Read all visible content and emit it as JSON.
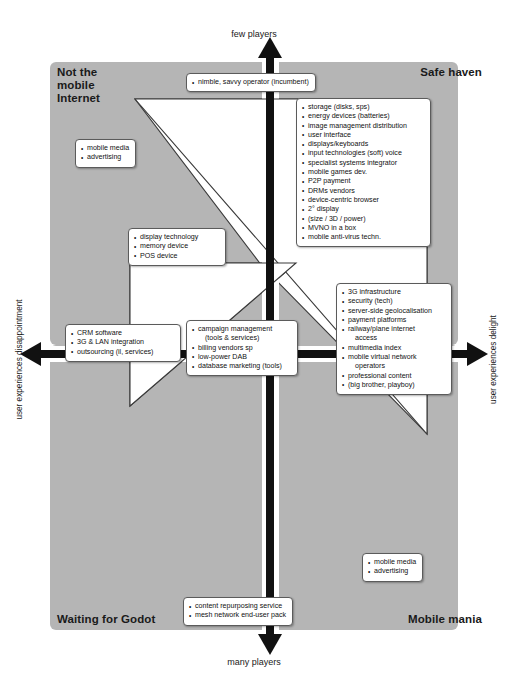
{
  "diagram": {
    "colors": {
      "quadrant_fill": "#b5b5b5",
      "center_fill": "#ffffff",
      "arrow": "#111111",
      "box_border": "#5b5b5b",
      "text": "#111111"
    },
    "axes": {
      "top_label": "few players",
      "bottom_label": "many players",
      "left_label": "user experiences disappointment",
      "right_label": "user experiences delight"
    },
    "quadrants": [
      {
        "id": "top-left",
        "label": "Not the\nmobile\nInternet"
      },
      {
        "id": "top-right",
        "label": "Safe haven"
      },
      {
        "id": "bottom-left",
        "label": "Waiting for Godot"
      },
      {
        "id": "bottom-right",
        "label": "Mobile mania"
      }
    ],
    "callouts": {
      "top": {
        "id": "top-center-callout",
        "items": [
          {
            "text": "nimble, savvy operator (incumbent)",
            "bullet": true
          }
        ]
      },
      "north_east": {
        "id": "safe-haven-list",
        "items": [
          {
            "text": "storage (disks, sps)",
            "bullet": true
          },
          {
            "text": "energy devices (batteries)",
            "bullet": true
          },
          {
            "text": "image management distribution",
            "bullet": true
          },
          {
            "text": "user interface",
            "bullet": true
          },
          {
            "text": "displays/keyboards",
            "bullet": true
          },
          {
            "text": "input technologies (soft) voice",
            "bullet": true
          },
          {
            "text": "specialist systems integrator",
            "bullet": true
          },
          {
            "text": "mobile games dev.",
            "bullet": true
          },
          {
            "text": "P2P payment",
            "bullet": true
          },
          {
            "text": "DRMs vendors",
            "bullet": true
          },
          {
            "text": "device-centric browser",
            "bullet": true
          },
          {
            "text": "2° display",
            "bullet": true
          },
          {
            "text": "(size / 3D / power)",
            "bullet": true
          },
          {
            "text": "MVNO in a box",
            "bullet": true
          },
          {
            "text": "mobile anti-virus techn.",
            "bullet": true
          }
        ]
      },
      "north_west": {
        "id": "not-the-mobile-internet-list",
        "items": [
          {
            "text": "mobile media",
            "bullet": true
          },
          {
            "text": "advertising",
            "bullet": true
          }
        ]
      },
      "mid_left_upper": {
        "id": "display-technology-list",
        "items": [
          {
            "text": "display technology",
            "bullet": true
          },
          {
            "text": "memory device",
            "bullet": true
          },
          {
            "text": "POS device",
            "bullet": true
          }
        ]
      },
      "west": {
        "id": "disappointment-list",
        "items": [
          {
            "text": "CRM software",
            "bullet": true
          },
          {
            "text": "3G & LAN integration",
            "bullet": true
          },
          {
            "text": "outsourcing (il, services)",
            "bullet": true
          }
        ]
      },
      "center": {
        "id": "center-list",
        "items": [
          {
            "text": "campaign management",
            "bullet": true
          },
          {
            "text": "(tools & services)",
            "bullet": false,
            "continuation": true
          },
          {
            "text": "billing vendors sp",
            "bullet": true
          },
          {
            "text": "low-power DAB",
            "bullet": true
          },
          {
            "text": "database marketing (tools)",
            "bullet": true
          }
        ]
      },
      "east": {
        "id": "delight-list",
        "items": [
          {
            "text": "3G infrastructure",
            "bullet": true
          },
          {
            "text": "security (tech)",
            "bullet": true
          },
          {
            "text": "server-side geolocalisation",
            "bullet": true
          },
          {
            "text": "payment platforms",
            "bullet": true
          },
          {
            "text": "railway/plane internet",
            "bullet": true
          },
          {
            "text": "access",
            "bullet": false,
            "continuation": true
          },
          {
            "text": "multimedia index",
            "bullet": true
          },
          {
            "text": "mobile virtual network",
            "bullet": true
          },
          {
            "text": "operators",
            "bullet": false,
            "continuation": true
          },
          {
            "text": "professional content",
            "bullet": true
          },
          {
            "text": "(big brother, playboy)",
            "bullet": true
          }
        ]
      },
      "south_east": {
        "id": "mobile-mania-list",
        "items": [
          {
            "text": "mobile media",
            "bullet": true
          },
          {
            "text": "advertising",
            "bullet": true
          }
        ]
      },
      "bottom": {
        "id": "bottom-center-callout",
        "items": [
          {
            "text": "content repurposing service",
            "bullet": true
          },
          {
            "text": "mesh network end-user pack",
            "bullet": true
          }
        ]
      }
    }
  }
}
